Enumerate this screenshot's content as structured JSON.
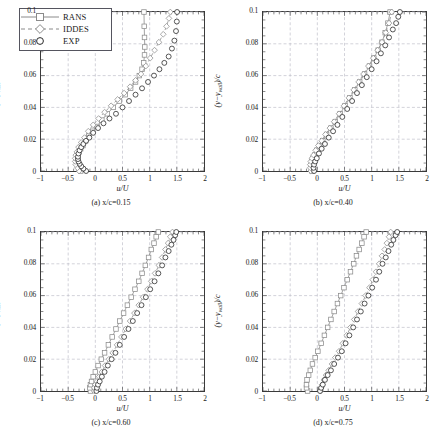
{
  "figure": {
    "axis": {
      "xlabel": "u/U",
      "ylabel": "(y − y_wall)/c",
      "xticks": [
        "−1",
        "−0.5",
        "0",
        "0.5",
        "1",
        "1.5",
        "2"
      ],
      "xtickvals": [
        -1,
        -0.5,
        0,
        0.5,
        1,
        1.5,
        2
      ],
      "yticks": [
        "0",
        "0.02",
        "0.04",
        "0.06",
        "0.08",
        "0.1"
      ],
      "ytickvals": [
        0,
        0.02,
        0.04,
        0.06,
        0.08,
        0.1
      ],
      "xlim": [
        -1,
        2
      ],
      "ylim": [
        0,
        0.1
      ],
      "grid": true
    },
    "legend": {
      "position": "top-left-panel-a",
      "entries": [
        {
          "label": "RANS",
          "marker": "square",
          "line": "solid",
          "color": "#8a8a8a"
        },
        {
          "label": "IDDES",
          "marker": "diamond",
          "line": "dashed",
          "color": "#8a8a8a"
        },
        {
          "label": "EXP",
          "marker": "circle",
          "line": "none",
          "color": "#2b2b2b"
        }
      ]
    },
    "captions": {
      "a": "(a)  x/c=0.15",
      "b": "(b)  x/c=0.40",
      "c": "(c)  x/c=0.60",
      "d": "(d)  x/c=0.75"
    }
  },
  "chart_data": [
    {
      "type": "line",
      "id": "panel-a",
      "title": "(a) x/c=0.15",
      "xlabel": "u/U",
      "ylabel": "(y-y_wall)/c",
      "xlim": [
        -1,
        2
      ],
      "ylim": [
        0,
        0.1
      ],
      "grid": true,
      "series": [
        {
          "name": "RANS",
          "marker": "square",
          "line": "solid",
          "color": "#8a8a8a",
          "x": [
            -0.27,
            -0.3,
            -0.32,
            -0.33,
            -0.33,
            -0.32,
            -0.3,
            -0.27,
            -0.23,
            -0.18,
            -0.12,
            -0.05,
            0.03,
            0.12,
            0.22,
            0.33,
            0.44,
            0.55,
            0.65,
            0.74,
            0.81,
            0.86,
            0.89,
            0.905,
            0.91,
            0.905,
            0.9,
            0.895
          ],
          "y": [
            0.0,
            0.002,
            0.004,
            0.006,
            0.008,
            0.01,
            0.012,
            0.014,
            0.016,
            0.019,
            0.022,
            0.025,
            0.028,
            0.032,
            0.036,
            0.04,
            0.044,
            0.048,
            0.052,
            0.056,
            0.06,
            0.064,
            0.068,
            0.073,
            0.078,
            0.084,
            0.091,
            0.1
          ]
        },
        {
          "name": "IDDES",
          "marker": "diamond",
          "line": "dashed",
          "color": "#8a8a8a",
          "x": [
            -0.3,
            -0.33,
            -0.36,
            -0.37,
            -0.37,
            -0.36,
            -0.34,
            -0.31,
            -0.26,
            -0.2,
            -0.13,
            -0.04,
            0.06,
            0.17,
            0.29,
            0.41,
            0.53,
            0.64,
            0.74,
            0.84,
            0.93,
            1.01,
            1.09,
            1.17,
            1.25,
            1.31,
            1.355,
            1.38
          ],
          "y": [
            0.0,
            0.002,
            0.004,
            0.006,
            0.008,
            0.01,
            0.012,
            0.015,
            0.018,
            0.021,
            0.025,
            0.029,
            0.033,
            0.037,
            0.041,
            0.045,
            0.049,
            0.053,
            0.057,
            0.061,
            0.066,
            0.071,
            0.076,
            0.081,
            0.086,
            0.091,
            0.096,
            0.1
          ]
        },
        {
          "name": "EXP",
          "marker": "circle",
          "line": "none",
          "color": "#2b2b2b",
          "x": [
            -0.17,
            -0.22,
            -0.26,
            -0.29,
            -0.31,
            -0.32,
            -0.32,
            -0.31,
            -0.29,
            -0.26,
            -0.22,
            -0.17,
            -0.11,
            -0.04,
            0.05,
            0.15,
            0.26,
            0.38,
            0.5,
            0.62,
            0.74,
            0.86,
            0.97,
            1.08,
            1.18,
            1.27,
            1.35,
            1.41,
            1.455,
            1.485,
            1.5,
            1.505
          ],
          "y": [
            0.0,
            0.0015,
            0.003,
            0.0045,
            0.006,
            0.0075,
            0.009,
            0.011,
            0.013,
            0.015,
            0.017,
            0.019,
            0.021,
            0.024,
            0.027,
            0.03,
            0.033,
            0.036,
            0.04,
            0.044,
            0.048,
            0.052,
            0.056,
            0.06,
            0.064,
            0.068,
            0.072,
            0.077,
            0.082,
            0.088,
            0.094,
            0.1
          ]
        }
      ]
    },
    {
      "type": "line",
      "id": "panel-b",
      "title": "(b) x/c=0.40",
      "xlabel": "u/U",
      "ylabel": "(y-y_wall)/c",
      "xlim": [
        -1,
        2
      ],
      "ylim": [
        0,
        0.1
      ],
      "grid": true,
      "series": [
        {
          "name": "RANS",
          "marker": "square",
          "line": "solid",
          "color": "#8a8a8a",
          "x": [
            -0.1,
            -0.11,
            -0.11,
            -0.1,
            -0.08,
            -0.05,
            -0.01,
            0.04,
            0.1,
            0.17,
            0.25,
            0.33,
            0.42,
            0.51,
            0.6,
            0.69,
            0.78,
            0.87,
            0.96,
            1.04,
            1.12,
            1.19,
            1.25,
            1.3,
            1.34
          ],
          "y": [
            0.0,
            0.002,
            0.004,
            0.006,
            0.008,
            0.01,
            0.013,
            0.016,
            0.019,
            0.023,
            0.027,
            0.031,
            0.036,
            0.041,
            0.046,
            0.051,
            0.056,
            0.061,
            0.066,
            0.071,
            0.076,
            0.081,
            0.087,
            0.093,
            0.1
          ]
        },
        {
          "name": "IDDES",
          "marker": "diamond",
          "line": "dashed",
          "color": "#8a8a8a",
          "x": [
            -0.12,
            -0.13,
            -0.13,
            -0.12,
            -0.1,
            -0.07,
            -0.03,
            0.02,
            0.08,
            0.15,
            0.23,
            0.31,
            0.4,
            0.49,
            0.58,
            0.67,
            0.76,
            0.85,
            0.94,
            1.03,
            1.11,
            1.19,
            1.26,
            1.32,
            1.37
          ],
          "y": [
            0.0,
            0.002,
            0.004,
            0.006,
            0.008,
            0.01,
            0.013,
            0.016,
            0.019,
            0.023,
            0.027,
            0.031,
            0.036,
            0.041,
            0.046,
            0.051,
            0.056,
            0.061,
            0.066,
            0.071,
            0.076,
            0.081,
            0.087,
            0.093,
            0.1
          ]
        },
        {
          "name": "EXP",
          "marker": "circle",
          "line": "none",
          "color": "#2b2b2b",
          "x": [
            -0.06,
            -0.07,
            -0.06,
            -0.04,
            -0.01,
            0.03,
            0.08,
            0.14,
            0.21,
            0.29,
            0.37,
            0.46,
            0.55,
            0.64,
            0.73,
            0.82,
            0.91,
            1.0,
            1.09,
            1.17,
            1.25,
            1.32,
            1.39,
            1.45,
            1.49,
            1.52
          ],
          "y": [
            0.0,
            0.002,
            0.004,
            0.006,
            0.008,
            0.011,
            0.014,
            0.017,
            0.021,
            0.025,
            0.029,
            0.034,
            0.039,
            0.044,
            0.049,
            0.054,
            0.059,
            0.064,
            0.069,
            0.074,
            0.079,
            0.084,
            0.089,
            0.093,
            0.097,
            0.1
          ]
        }
      ]
    },
    {
      "type": "line",
      "id": "panel-c",
      "title": "(c) x/c=0.60",
      "xlabel": "u/U",
      "ylabel": "(y-y_wall)/c",
      "xlim": [
        -1,
        2
      ],
      "ylim": [
        0,
        0.1
      ],
      "grid": true,
      "series": [
        {
          "name": "RANS",
          "marker": "square",
          "line": "solid",
          "color": "#8a8a8a",
          "x": [
            -0.09,
            -0.1,
            -0.09,
            -0.07,
            -0.04,
            0.0,
            0.05,
            0.11,
            0.17,
            0.24,
            0.31,
            0.38,
            0.45,
            0.52,
            0.59,
            0.66,
            0.73,
            0.8,
            0.86,
            0.92,
            0.98,
            1.03,
            1.08,
            1.12,
            1.16
          ],
          "y": [
            0.0,
            0.002,
            0.004,
            0.006,
            0.009,
            0.012,
            0.016,
            0.02,
            0.024,
            0.029,
            0.034,
            0.039,
            0.044,
            0.049,
            0.054,
            0.059,
            0.064,
            0.069,
            0.074,
            0.079,
            0.084,
            0.089,
            0.093,
            0.097,
            0.1
          ]
        },
        {
          "name": "IDDES",
          "marker": "diamond",
          "line": "dashed",
          "color": "#8a8a8a",
          "x": [
            -0.02,
            -0.02,
            0.0,
            0.03,
            0.07,
            0.12,
            0.18,
            0.25,
            0.32,
            0.4,
            0.48,
            0.56,
            0.64,
            0.72,
            0.8,
            0.88,
            0.96,
            1.03,
            1.1,
            1.17,
            1.23,
            1.29,
            1.34,
            1.38,
            1.42
          ],
          "y": [
            0.0,
            0.002,
            0.004,
            0.006,
            0.009,
            0.012,
            0.016,
            0.02,
            0.024,
            0.029,
            0.034,
            0.039,
            0.044,
            0.049,
            0.054,
            0.059,
            0.064,
            0.069,
            0.074,
            0.079,
            0.084,
            0.089,
            0.093,
            0.097,
            0.1
          ]
        },
        {
          "name": "EXP",
          "marker": "circle",
          "line": "none",
          "color": "#2b2b2b",
          "x": [
            0.02,
            0.03,
            0.05,
            0.08,
            0.12,
            0.17,
            0.23,
            0.3,
            0.37,
            0.45,
            0.53,
            0.61,
            0.69,
            0.77,
            0.85,
            0.93,
            1.01,
            1.09,
            1.16,
            1.23,
            1.29,
            1.35,
            1.4,
            1.44,
            1.47,
            1.49
          ],
          "y": [
            0.0,
            0.002,
            0.004,
            0.006,
            0.009,
            0.012,
            0.016,
            0.02,
            0.024,
            0.029,
            0.034,
            0.039,
            0.044,
            0.049,
            0.054,
            0.059,
            0.064,
            0.069,
            0.074,
            0.079,
            0.084,
            0.088,
            0.092,
            0.095,
            0.098,
            0.1
          ]
        }
      ]
    },
    {
      "type": "line",
      "id": "panel-d",
      "title": "(d) x/c=0.75",
      "xlabel": "u/U",
      "ylabel": "(y-y_wall)/c",
      "xlim": [
        -1,
        2
      ],
      "ylim": [
        0,
        0.1
      ],
      "grid": true,
      "series": [
        {
          "name": "RANS",
          "marker": "square",
          "line": "solid",
          "color": "#8a8a8a",
          "x": [
            -0.18,
            -0.2,
            -0.2,
            -0.19,
            -0.16,
            -0.13,
            -0.09,
            -0.04,
            0.01,
            0.07,
            0.13,
            0.19,
            0.25,
            0.31,
            0.37,
            0.43,
            0.49,
            0.55,
            0.61,
            0.67,
            0.72,
            0.77,
            0.82,
            0.86,
            0.9
          ],
          "y": [
            0.0,
            0.002,
            0.004,
            0.007,
            0.01,
            0.013,
            0.017,
            0.021,
            0.025,
            0.03,
            0.035,
            0.04,
            0.045,
            0.05,
            0.055,
            0.06,
            0.065,
            0.07,
            0.075,
            0.08,
            0.085,
            0.089,
            0.093,
            0.097,
            0.1
          ]
        },
        {
          "name": "IDDES",
          "marker": "diamond",
          "line": "dashed",
          "color": "#8a8a8a",
          "x": [
            0.06,
            0.07,
            0.09,
            0.12,
            0.16,
            0.21,
            0.27,
            0.33,
            0.4,
            0.47,
            0.54,
            0.61,
            0.68,
            0.75,
            0.82,
            0.89,
            0.96,
            1.02,
            1.08,
            1.14,
            1.19,
            1.24,
            1.28,
            1.32,
            1.35
          ],
          "y": [
            0.0,
            0.002,
            0.004,
            0.007,
            0.01,
            0.013,
            0.017,
            0.021,
            0.025,
            0.03,
            0.035,
            0.04,
            0.045,
            0.05,
            0.055,
            0.06,
            0.065,
            0.07,
            0.075,
            0.08,
            0.085,
            0.089,
            0.093,
            0.097,
            0.1
          ]
        },
        {
          "name": "EXP",
          "marker": "circle",
          "line": "none",
          "color": "#2b2b2b",
          "x": [
            0.05,
            0.07,
            0.1,
            0.14,
            0.19,
            0.25,
            0.31,
            0.38,
            0.45,
            0.52,
            0.59,
            0.66,
            0.73,
            0.8,
            0.87,
            0.94,
            1.01,
            1.08,
            1.14,
            1.2,
            1.26,
            1.31,
            1.36,
            1.4,
            1.44,
            1.47
          ],
          "y": [
            0.0,
            0.002,
            0.004,
            0.007,
            0.01,
            0.013,
            0.017,
            0.021,
            0.025,
            0.03,
            0.035,
            0.04,
            0.045,
            0.05,
            0.055,
            0.06,
            0.065,
            0.07,
            0.075,
            0.08,
            0.084,
            0.088,
            0.092,
            0.095,
            0.098,
            0.1
          ]
        }
      ]
    }
  ]
}
